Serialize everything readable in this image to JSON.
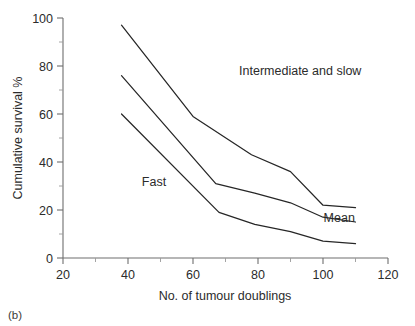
{
  "figure": {
    "panel_label": "(b)"
  },
  "chart_data": {
    "type": "line",
    "title": "",
    "xlabel": "No. of tumour doublings",
    "ylabel": "Cumulative survival %",
    "xlim": [
      20,
      120
    ],
    "ylim": [
      0,
      100
    ],
    "xticks": [
      20,
      40,
      60,
      80,
      100,
      120
    ],
    "xticklabels": [
      "20",
      "40",
      "60",
      "80",
      "100",
      "120"
    ],
    "xminorticks": [
      30,
      50,
      70,
      90,
      110
    ],
    "yticks": [
      0,
      20,
      40,
      60,
      80,
      100
    ],
    "yticklabels": [
      "0",
      "20",
      "40",
      "60",
      "80",
      "100"
    ],
    "yminorticks": [
      10,
      30,
      50,
      70,
      90
    ],
    "grid": false,
    "legend_position": "inline-annotations",
    "series": [
      {
        "name": "Intermediate and slow",
        "x": [
          38,
          60,
          78,
          90,
          100,
          110
        ],
        "y": [
          97,
          59,
          43,
          36,
          22,
          21
        ]
      },
      {
        "name": "Mean",
        "x": [
          38,
          67,
          79,
          90,
          100,
          110
        ],
        "y": [
          76,
          31,
          27,
          23,
          17,
          15
        ]
      },
      {
        "name": "Fast",
        "x": [
          38,
          68,
          79,
          90,
          100,
          110
        ],
        "y": [
          60,
          19,
          14,
          11,
          7,
          6
        ]
      }
    ],
    "annotations": [
      {
        "text": "Intermediate and slow",
        "x": 93,
        "y": 78,
        "anchor": "middle"
      },
      {
        "text": "Fast",
        "x": 48,
        "y": 32,
        "anchor": "middle"
      },
      {
        "text": "Mean",
        "x": 105,
        "y": 17,
        "anchor": "middle"
      }
    ]
  }
}
